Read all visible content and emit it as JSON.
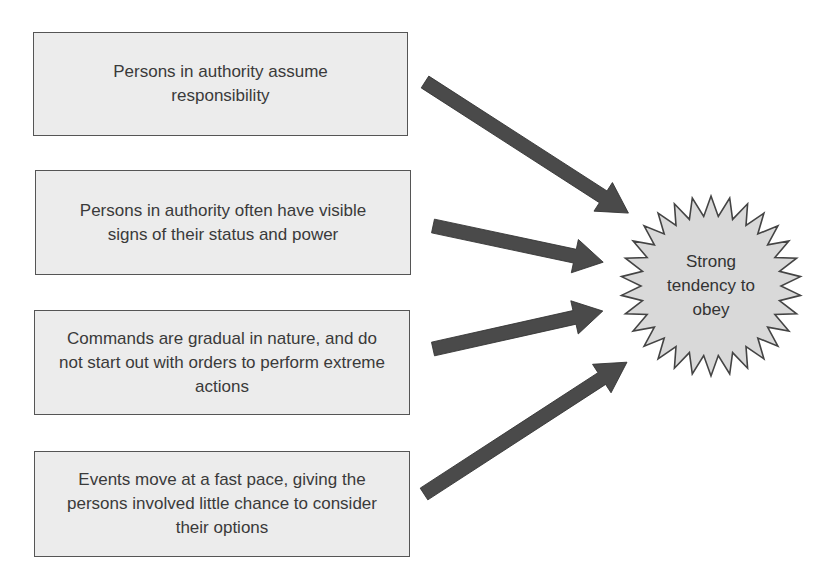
{
  "diagram": {
    "causes": [
      {
        "text": "Persons in authority assume responsibility"
      },
      {
        "text": "Persons in authority often have visible signs of their status and power"
      },
      {
        "text": "Commands are gradual in nature, and do not start out with orders to perform extreme actions"
      },
      {
        "text": "Events move at a fast pace, giving the persons involved little chance to consider their options"
      }
    ],
    "outcome": {
      "text": "Strong tendency to obey"
    },
    "colors": {
      "box_fill": "#ececec",
      "box_border": "#555555",
      "arrow_fill": "#4a4a4a",
      "burst_fill": "#d9d9d9",
      "burst_stroke": "#444444"
    }
  }
}
